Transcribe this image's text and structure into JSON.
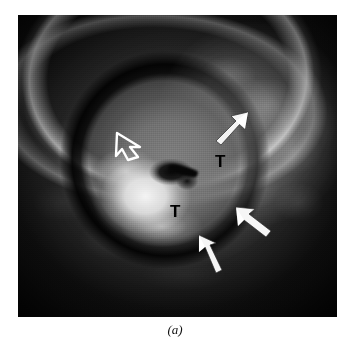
{
  "figure": {
    "caption": "(a)",
    "panel_letter": "a",
    "modality": "grayscale-sectional-scan",
    "background_color": "#ffffff",
    "plate_color": "#050505"
  },
  "image": {
    "alt": "grayscale cross-sectional medical scan showing an ovoid mass with a dark hypoechoic rim and a bright central echogenic focus",
    "x": 18,
    "y": 15,
    "width": 319,
    "height": 302
  },
  "annotations": {
    "labels": [
      {
        "id": "tumour-1",
        "text": "T",
        "x": 197,
        "y": 138,
        "color": "#000000"
      },
      {
        "id": "tumour-2",
        "text": "T",
        "x": 152,
        "y": 188,
        "color": "#000000"
      }
    ],
    "arrows": [
      {
        "id": "open-left",
        "style": "open",
        "direction": "right",
        "x": 96,
        "y": 112,
        "color": "#ffffff"
      },
      {
        "id": "upper-right",
        "style": "filled",
        "direction": "down-left",
        "x": 196,
        "y": 88,
        "color": "#ffffff"
      },
      {
        "id": "right",
        "style": "filled",
        "direction": "up-left",
        "x": 214,
        "y": 186,
        "color": "#ffffff"
      },
      {
        "id": "bottom",
        "style": "filled",
        "direction": "up-left",
        "x": 178,
        "y": 218,
        "color": "#ffffff"
      }
    ]
  }
}
